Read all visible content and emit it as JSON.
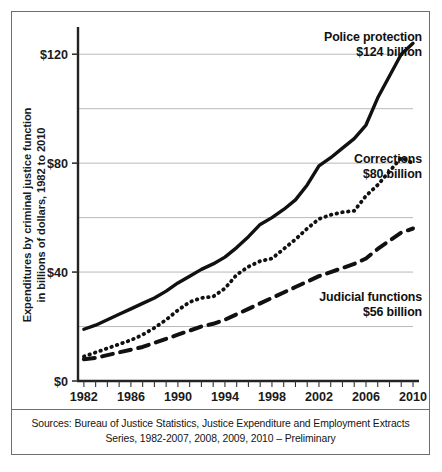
{
  "figure": {
    "y_axis_title_line1": "Expenditures by criminal justice function",
    "y_axis_title_line2": "in billions of dollars, 1982 to 2010",
    "source_line1": "Sources:  Bureau of Justice Statistics, Justice Expenditure and Employment Extracts",
    "source_line2": "Series, 1982-2007, 2008, 2009, 2010 – Preliminary"
  },
  "annotations": {
    "police": {
      "name": "Police protection",
      "value": "$124 billion"
    },
    "corrections": {
      "name": "Corrections",
      "value": "$80 billion"
    },
    "judicial": {
      "name": "Judicial functions",
      "value": "$56 billion"
    }
  },
  "axes": {
    "y_ticks": [
      "$0",
      "$40",
      "$80",
      "$120"
    ],
    "y_tick_values": [
      0,
      40,
      80,
      120
    ],
    "y_gridlines": [
      20,
      40,
      60,
      80,
      100,
      120
    ],
    "x_ticks": [
      "1982",
      "1986",
      "1990",
      "1994",
      "1998",
      "2002",
      "2006",
      "2010"
    ],
    "x_tick_values": [
      1982,
      1986,
      1990,
      1994,
      1998,
      2002,
      2006,
      2010
    ]
  },
  "style": {
    "line_color": "#111111",
    "grid_color": "#b9b9b9",
    "axis_color": "#333333",
    "frame_color": "#6e6e6e",
    "text_color": "#1a1a1a"
  },
  "chart_data": {
    "type": "line",
    "title": "",
    "xlabel": "",
    "ylabel": "Expenditures by criminal justice function in billions of dollars, 1982 to 2010",
    "xlim": [
      1981.5,
      2010
    ],
    "ylim": [
      0,
      130
    ],
    "grid": true,
    "legend": "inline-annotations",
    "x": [
      1982,
      1983,
      1984,
      1985,
      1986,
      1987,
      1988,
      1989,
      1990,
      1991,
      1992,
      1993,
      1994,
      1995,
      1996,
      1997,
      1998,
      1999,
      2000,
      2001,
      2002,
      2003,
      2004,
      2005,
      2006,
      2007,
      2008,
      2009,
      2010
    ],
    "series": [
      {
        "name": "Police protection",
        "style": "solid",
        "end_label": "$124 billion",
        "values": [
          19.0,
          20.5,
          22.5,
          24.5,
          26.5,
          28.5,
          30.5,
          33.0,
          36.0,
          38.5,
          41.0,
          43.0,
          45.5,
          49.0,
          53.0,
          57.5,
          60.0,
          63.0,
          66.5,
          72.0,
          79.0,
          82.0,
          85.5,
          89.0,
          94.0,
          104.0,
          112.0,
          120.0,
          124.0
        ]
      },
      {
        "name": "Corrections",
        "style": "dotted",
        "end_label": "$80 billion",
        "values": [
          9.0,
          10.5,
          12.0,
          13.5,
          15.0,
          17.0,
          19.5,
          22.5,
          26.0,
          29.0,
          30.5,
          31.0,
          34.0,
          39.0,
          42.0,
          44.0,
          45.0,
          48.5,
          52.0,
          56.0,
          59.5,
          61.0,
          62.0,
          62.5,
          68.0,
          72.0,
          77.0,
          82.0,
          80.0
        ]
      },
      {
        "name": "Judicial functions",
        "style": "dashed",
        "end_label": "$56 billion",
        "values": [
          8.0,
          8.5,
          9.5,
          10.5,
          11.5,
          12.5,
          14.0,
          15.5,
          17.0,
          18.5,
          20.0,
          21.0,
          22.5,
          24.5,
          26.5,
          28.5,
          30.5,
          32.5,
          34.5,
          36.5,
          38.5,
          40.0,
          41.5,
          43.0,
          45.0,
          48.5,
          51.5,
          54.5,
          56.0
        ]
      }
    ]
  }
}
